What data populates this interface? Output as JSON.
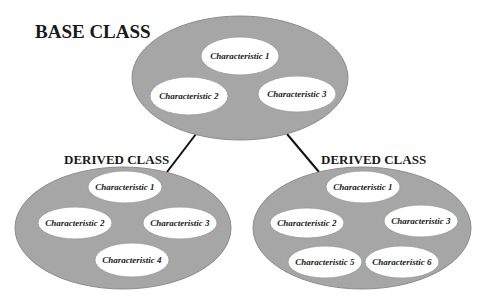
{
  "diagram": {
    "colors": {
      "class_fill": "#a6a6a6",
      "class_stroke": "#8c8c8c",
      "characteristic_fill": "#ffffff",
      "connector": "#111111",
      "text": "#1a1a1a"
    },
    "base_class": {
      "title": "BASE CLASS",
      "characteristics": [
        "Characteristic 1",
        "Characteristic 2",
        "Characteristic 3"
      ]
    },
    "derived_classes": [
      {
        "title": "DERIVED CLASS",
        "characteristics": [
          "Characteristic 1",
          "Characteristic 2",
          "Characteristic 3",
          "Characteristic 4"
        ]
      },
      {
        "title": "DERIVED CLASS",
        "characteristics": [
          "Characteristic 1",
          "Characteristic 2",
          "Characteristic 3",
          "Characteristic 5",
          "Characteristic 6"
        ]
      }
    ],
    "edges": [
      {
        "from": "base_class",
        "to": "derived_classes.0"
      },
      {
        "from": "base_class",
        "to": "derived_classes.1"
      }
    ]
  }
}
